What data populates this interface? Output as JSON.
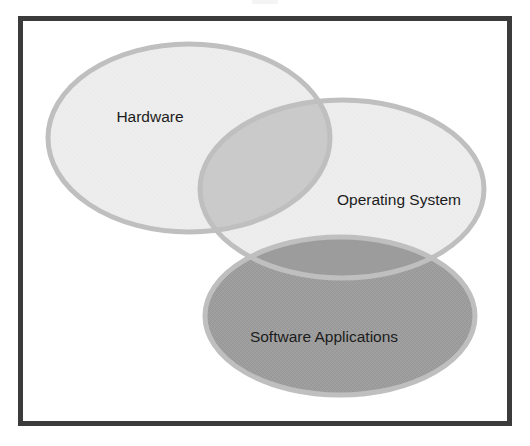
{
  "figure": {
    "type": "venn-diagram",
    "set_count": 3,
    "background_color": "#ffffff",
    "frame_color": "#3b3b3b",
    "frame_width_px": 5,
    "stroke_color": "#bfbfbf",
    "stroke_width_px": 5,
    "sets": [
      {
        "id": "hardware",
        "label": "Hardware",
        "fill_color": "#ececec",
        "label_x": 150,
        "label_y": 118,
        "cx": 189,
        "cy": 138,
        "rx": 141,
        "ry": 94
      },
      {
        "id": "operating-system",
        "label": "Operating System",
        "fill_color": "#ececec",
        "label_x": 399,
        "label_y": 201,
        "cx": 342,
        "cy": 189,
        "rx": 142,
        "ry": 89
      },
      {
        "id": "software-applications",
        "label": "Software Applications",
        "fill_color": "#9c9c9c",
        "label_x": 324,
        "label_y": 338,
        "cx": 340,
        "cy": 316,
        "rx": 135,
        "ry": 79
      }
    ],
    "intersections": [
      {
        "id": "hardware-operating-system",
        "sets": [
          "hardware",
          "operating-system"
        ],
        "fill_color": "#cacaca"
      },
      {
        "id": "operating-system-software-applications",
        "sets": [
          "operating-system",
          "software-applications"
        ],
        "fill_color": "#9c9c9c"
      }
    ]
  }
}
